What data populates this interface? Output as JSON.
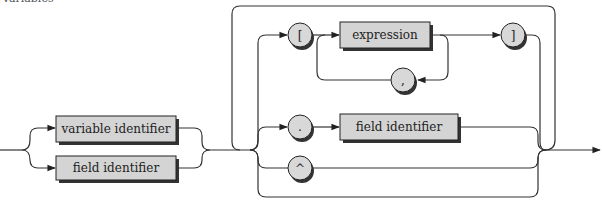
{
  "caption": "Variables",
  "diagram": {
    "type": "syntax-diagram",
    "entry_alternatives": [
      {
        "label": "variable identifier"
      },
      {
        "label": "field identifier"
      }
    ],
    "selector_branches": {
      "index": {
        "open": "[",
        "item": "expression",
        "separator": ",",
        "close": "]"
      },
      "field": {
        "dot": ".",
        "item": "field identifier"
      },
      "pointer": {
        "caret": "^"
      }
    },
    "colors": {
      "box_fill": "#d4d4d4",
      "circle_fill": "#d8d8d8",
      "line": "#333333"
    }
  }
}
